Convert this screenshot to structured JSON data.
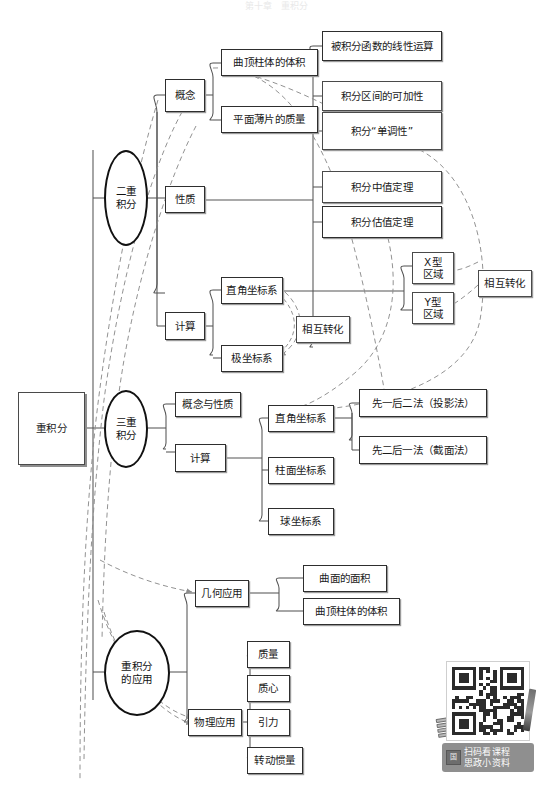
{
  "top_faint_text": "第十章　重积分",
  "colors": {
    "page_background": "#ffffff",
    "box_border": "#4a4a4a",
    "box_fill": "#ffffff",
    "box_shadow": "#9a9a9a",
    "ellipse_border": "#111111",
    "text": "#1a1a1a",
    "solid_connector": "#555555",
    "dashed_connector": "#8c8c8c",
    "qr_caption_background": "#8f8f8f",
    "qr_caption_text": "#ffffff"
  },
  "root": {
    "label": "重积分"
  },
  "branches": [
    {
      "id": "double-integral",
      "label": "二重积分",
      "shape": "ellipse",
      "children": [
        {
          "id": "concept",
          "label": "概念",
          "children": [
            {
              "id": "curved-top-cylinder-volume",
              "label": "曲顶柱体的体积"
            },
            {
              "id": "plane-lamina-mass",
              "label": "平面薄片的质量"
            }
          ]
        },
        {
          "id": "properties",
          "label": "性质",
          "children": [
            {
              "id": "linear-operation",
              "label": "被积分函数的线性运算"
            },
            {
              "id": "interval-additivity",
              "label": "积分区间的可加性"
            },
            {
              "id": "monotonicity",
              "label": "积分“单调性”"
            },
            {
              "id": "mean-value-theorem",
              "label": "积分中值定理"
            },
            {
              "id": "estimation-theorem",
              "label": "积分估值定理"
            }
          ]
        },
        {
          "id": "computation",
          "label": "计算",
          "children": [
            {
              "id": "cartesian-2d",
              "label": "直角坐标系",
              "children": [
                {
                  "id": "x-type-region",
                  "label": "X型\n区域"
                },
                {
                  "id": "y-type-region",
                  "label": "Y型\n区域"
                }
              ]
            },
            {
              "id": "polar-2d",
              "label": "极坐标系"
            }
          ],
          "annotations": [
            {
              "id": "mutual-conversion-coord",
              "label": "相互转化"
            },
            {
              "id": "mutual-conversion-region",
              "label": "相互转化"
            }
          ]
        }
      ]
    },
    {
      "id": "triple-integral",
      "label": "三重积分",
      "shape": "ellipse",
      "children": [
        {
          "id": "concept-and-properties",
          "label": "概念与性质"
        },
        {
          "id": "computation-3d",
          "label": "计算",
          "children": [
            {
              "id": "cartesian-3d",
              "label": "直角坐标系",
              "children": [
                {
                  "id": "first-one-then-two",
                  "label": "先一后二法（投影法）"
                },
                {
                  "id": "first-two-then-one",
                  "label": "先二后一法（截面法）"
                }
              ]
            },
            {
              "id": "cylindrical",
              "label": "柱面坐标系"
            },
            {
              "id": "spherical",
              "label": "球坐标系"
            }
          ]
        }
      ]
    },
    {
      "id": "applications",
      "label": "重积分\n的应用",
      "shape": "ellipse",
      "children": [
        {
          "id": "geometric-applications",
          "label": "几何应用",
          "children": [
            {
              "id": "surface-area",
              "label": "曲面的面积"
            },
            {
              "id": "curved-cylinder-volume",
              "label": "曲顶柱体的体积"
            }
          ]
        },
        {
          "id": "physical-applications",
          "label": "物理应用",
          "children": [
            {
              "id": "mass",
              "label": "质量"
            },
            {
              "id": "centroid",
              "label": "质心"
            },
            {
              "id": "gravitation",
              "label": "引力"
            },
            {
              "id": "moment-of-inertia",
              "label": "转动惯量"
            }
          ]
        }
      ]
    }
  ],
  "nodes": {
    "root": "重积分",
    "double_integral": "二重\n积分",
    "concept": "概念",
    "properties": "性质",
    "computation": "计算",
    "curved_top_cylinder_volume": "曲顶柱体的体积",
    "plane_lamina_mass": "平面薄片的质量",
    "linear_operation": "被积分函数的线性运算",
    "interval_additivity": "积分区间的可加性",
    "monotonicity": "积分“单调性”",
    "mean_value_theorem": "积分中值定理",
    "estimation_theorem": "积分估值定理",
    "cartesian_2d": "直角坐标系",
    "polar_2d": "极坐标系",
    "mutual_conversion_coord": "相互转化",
    "x_type_region": "X型\n区域",
    "y_type_region": "Y型\n区域",
    "mutual_conversion_region": "相互转化",
    "triple_integral": "三重\n积分",
    "concept_and_properties": "概念与性质",
    "computation_3d": "计算",
    "cartesian_3d": "直角坐标系",
    "cylindrical": "柱面坐标系",
    "spherical": "球坐标系",
    "first_one_then_two": "先一后二法（投影法）",
    "first_two_then_one": "先二后一法（截面法）",
    "applications": "重积分\n的应用",
    "geometric_applications": "几何应用",
    "physical_applications": "物理应用",
    "surface_area": "曲面的面积",
    "curved_cylinder_volume": "曲顶柱体的体积",
    "mass": "质量",
    "centroid": "质心",
    "gravitation": "引力",
    "moment_of_inertia": "转动惯量"
  },
  "qr": {
    "caption_line1": "扫码看课程",
    "caption_line2": "思政小资料",
    "caption_icon": "国",
    "icon_names": [
      "qr-code-icon",
      "pen-icon",
      "books-icon"
    ]
  }
}
